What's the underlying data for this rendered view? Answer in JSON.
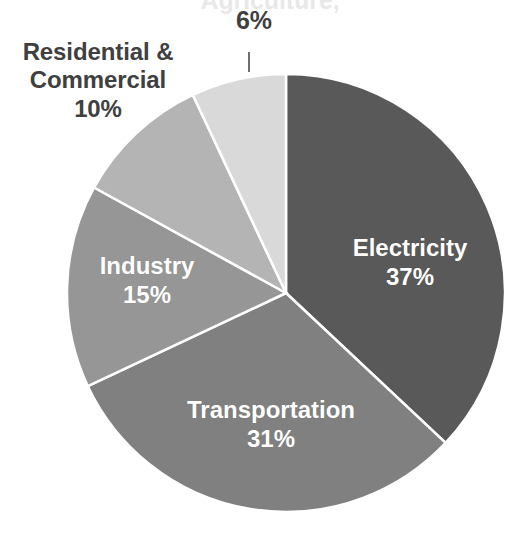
{
  "chart_data": {
    "type": "pie",
    "title": "",
    "subtitle": "",
    "xlabel": "",
    "ylabel": "",
    "legend_position": "none",
    "grid": false,
    "units": "percent",
    "total": 99,
    "start_angle_deg": 0,
    "direction": "clockwise",
    "categories": [
      "Electricity",
      "Transportation",
      "Industry",
      "Residential & Commercial",
      "Agriculture"
    ],
    "values": [
      37,
      31,
      15,
      10,
      6
    ],
    "colors": [
      "#595959",
      "#808080",
      "#969696",
      "#b4b4b4",
      "#d9d9d9"
    ],
    "slices": [
      {
        "name": "Electricity",
        "label": "Electricity",
        "value": 37,
        "value_label": "37%",
        "color": "#595959",
        "start_deg": 0,
        "end_deg": 133.2,
        "label_placement": "inside",
        "label_color": "#ffffff"
      },
      {
        "name": "Transportation",
        "label": "Transportation",
        "value": 31,
        "value_label": "31%",
        "color": "#808080",
        "start_deg": 133.2,
        "end_deg": 244.8,
        "label_placement": "inside",
        "label_color": "#ffffff"
      },
      {
        "name": "Industry",
        "label": "Industry",
        "value": 15,
        "value_label": "15%",
        "color": "#969696",
        "start_deg": 244.8,
        "end_deg": 298.8,
        "label_placement": "inside",
        "label_color": "#ffffff"
      },
      {
        "name": "Residential & Commercial",
        "label_line1": "Residential &",
        "label_line2": "Commercial",
        "value": 10,
        "value_label": "10%",
        "color": "#b4b4b4",
        "start_deg": 298.8,
        "end_deg": 334.8,
        "label_placement": "outside",
        "label_color": "#404040"
      },
      {
        "name": "Agriculture",
        "label": "Agriculture,",
        "value": 6,
        "value_label": "6%",
        "color": "#d9d9d9",
        "start_deg": 334.8,
        "end_deg": 360,
        "label_placement": "outside-cropped",
        "label_color": "#404040",
        "has_leader_line": true
      }
    ]
  },
  "labels": {
    "agriculture_name": "Agriculture,",
    "agriculture_pct": "6%",
    "rescom_line1": "Residential &",
    "rescom_line2": "Commercial",
    "rescom_pct": "10%",
    "electricity_name": "Electricity",
    "electricity_pct": "37%",
    "transportation_name": "Transportation",
    "transportation_pct": "31%",
    "industry_name": "Industry",
    "industry_pct": "15%"
  },
  "geometry": {
    "center_x": 286,
    "center_y": 293,
    "radius": 219
  }
}
